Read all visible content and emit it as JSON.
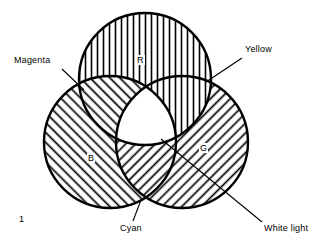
{
  "figure": {
    "number": "1",
    "background_color": "#ffffff",
    "line_color": "#000000"
  },
  "diagram": {
    "type": "venn-three-circle",
    "circles": [
      {
        "id": "red",
        "label": "R",
        "label_full": "Red",
        "hatch": "vertical",
        "cx": 145,
        "cy": 79,
        "r": 66,
        "label_x": 136,
        "label_y": 55
      },
      {
        "id": "blue",
        "label": "B",
        "label_full": "Blue",
        "hatch": "diagonal-up",
        "cx": 110,
        "cy": 142,
        "r": 66,
        "label_x": 87,
        "label_y": 153
      },
      {
        "id": "green",
        "label": "G",
        "label_full": "Green",
        "hatch": "diagonal-down",
        "cx": 182,
        "cy": 142,
        "r": 66,
        "label_x": 199,
        "label_y": 143
      }
    ],
    "callouts": [
      {
        "id": "magenta",
        "label": "Magenta",
        "text_x": 13,
        "text_y": 55,
        "leader_from_x": 62,
        "leader_from_y": 69,
        "leader_to_x": 84,
        "leader_to_y": 90,
        "describes": "overlap of red and blue"
      },
      {
        "id": "yellow",
        "label": "Yellow",
        "text_x": 244,
        "text_y": 44,
        "leader_from_x": 242,
        "leader_from_y": 58,
        "leader_to_x": 206,
        "leader_to_y": 82,
        "describes": "overlap of red and green"
      },
      {
        "id": "cyan",
        "label": "Cyan",
        "text_x": 119,
        "text_y": 223,
        "leader_from_x": 133,
        "leader_from_y": 221,
        "leader_to_x": 141,
        "leader_to_y": 200,
        "describes": "overlap of blue and green"
      },
      {
        "id": "white-light",
        "label": "White light",
        "text_x": 263,
        "text_y": 223,
        "leader_from_x": 262,
        "leader_from_y": 222,
        "leader_to_x": 161,
        "leader_to_y": 139,
        "describes": "central overlap of all three circles"
      }
    ]
  }
}
